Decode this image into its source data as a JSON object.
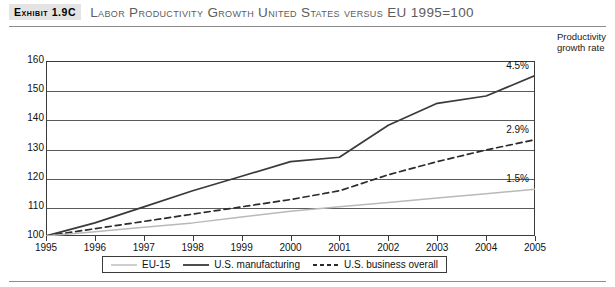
{
  "header": {
    "exhibit_tag": "Exhibit 1.9C",
    "title": "Labor Productivity Growth United States versus EU 1995=100"
  },
  "axis_note": {
    "line1": "Productivity",
    "line2": "growth rate"
  },
  "legend": {
    "items": [
      {
        "label": "EU-15",
        "style": "solid-light",
        "color": "#b9b9b9"
      },
      {
        "label": "U.S. manufacturing",
        "style": "solid-dark",
        "color": "#3a3a3a"
      },
      {
        "label": "U.S. business overall",
        "style": "dashed",
        "color": "#2b2b2b"
      }
    ]
  },
  "annotations": [
    {
      "text": "4.5%",
      "series": "U.S. manufacturing"
    },
    {
      "text": "2.9%",
      "series": "U.S. business overall"
    },
    {
      "text": "1.5%",
      "series": "EU-15"
    }
  ],
  "chart_data": {
    "type": "line",
    "title": "Labor Productivity Growth United States versus EU 1995=100",
    "xlabel": "",
    "ylabel": "",
    "ylim": [
      100,
      160
    ],
    "ytick_values": [
      100,
      110,
      120,
      130,
      140,
      150,
      160
    ],
    "ytick_labels": [
      "100",
      "110",
      "120",
      "130",
      "140",
      "150",
      "160"
    ],
    "grid": true,
    "legend_position": "bottom",
    "categories": [
      1995,
      1996,
      1997,
      1998,
      1999,
      2000,
      2001,
      2002,
      2003,
      2004,
      2005
    ],
    "xtick_labels": [
      "1995",
      "1996",
      "1997",
      "1998",
      "1999",
      "2000",
      "2001",
      "2002",
      "2003",
      "2004",
      "2005"
    ],
    "series": [
      {
        "name": "U.S. manufacturing",
        "values": [
          100,
          104.5,
          110.0,
          115.5,
          120.5,
          125.5,
          127.0,
          138.0,
          145.5,
          148.0,
          155.0
        ],
        "growth_rate_label": "4.5%",
        "style": "solid",
        "color": "#3a3a3a"
      },
      {
        "name": "U.S. business overall",
        "values": [
          100,
          102.5,
          105.0,
          107.5,
          110.0,
          112.5,
          115.5,
          121.0,
          125.5,
          129.5,
          133.0
        ],
        "growth_rate_label": "2.9%",
        "style": "dashed",
        "color": "#2b2b2b"
      },
      {
        "name": "EU-15",
        "values": [
          100,
          101.5,
          103.0,
          104.5,
          106.5,
          108.5,
          110.0,
          111.5,
          113.0,
          114.5,
          116.0
        ],
        "growth_rate_label": "1.5%",
        "style": "solid",
        "color": "#b9b9b9"
      }
    ]
  }
}
